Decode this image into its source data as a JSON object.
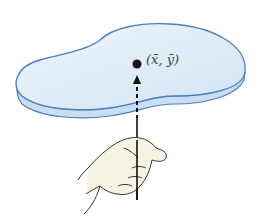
{
  "figure": {
    "centroid_label": "(x̄, ȳ)",
    "colors": {
      "plate_fill": "#dceaf7",
      "plate_edge": "#4a7fc1",
      "plate_side": "#c9def3",
      "hand_fill": "#f7f3e4",
      "hand_stroke": "#333333",
      "rod": "#111111"
    }
  }
}
